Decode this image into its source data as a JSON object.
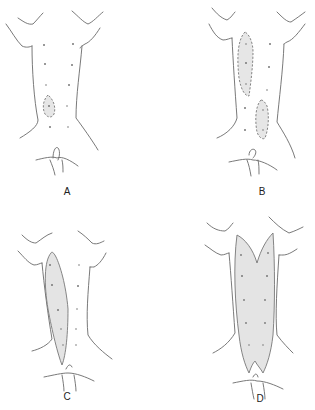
{
  "figure": {
    "panels": [
      {
        "id": "A",
        "label": "A",
        "description": "Back with single small dashed outlined area lower left"
      },
      {
        "id": "B",
        "label": "B",
        "description": "Back with two dashed elongated areas (upper left, lower right)"
      },
      {
        "id": "C",
        "label": "C",
        "description": "Back with shaded elongated strip along left side of spine"
      },
      {
        "id": "D",
        "label": "D",
        "description": "Back with large shaded region covering both sides of spine"
      }
    ],
    "colors": {
      "line": "#6a6a6a",
      "shade": "#e4e4e4",
      "background": "#ffffff"
    }
  }
}
